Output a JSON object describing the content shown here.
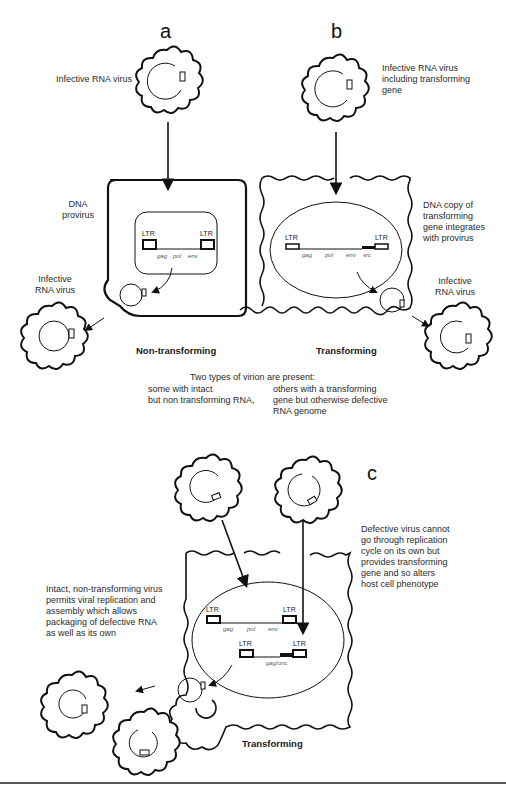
{
  "panels": {
    "a": {
      "letter": "a",
      "top_label": "Infective RNA virus",
      "side_label": [
        "DNA",
        "provirus"
      ],
      "exit_label": [
        "Infective",
        "RNA virus"
      ],
      "genes": [
        "gag",
        "pol",
        "env"
      ],
      "ltr": "LTR",
      "caption": "Non-transforming"
    },
    "b": {
      "letter": "b",
      "top_label": [
        "Infective RNA virus",
        "including transforming",
        "gene"
      ],
      "side_label": [
        "DNA copy of",
        "transforming",
        "gene integrates",
        "with provirus"
      ],
      "exit_label": [
        "Infective",
        "RNA virus"
      ],
      "genes": [
        "gag",
        "pol",
        "env",
        "src"
      ],
      "ltr": "LTR",
      "caption": "Transforming"
    },
    "middle": {
      "heading": "Two types of virion are present:",
      "left": [
        "some with intact",
        "but non transforming RNA,"
      ],
      "right": [
        "others with a transforming",
        "gene but otherwise defective",
        "RNA genome"
      ]
    },
    "c": {
      "letter": "c",
      "right_label": [
        "Defective virus cannot",
        "go through replication",
        "cycle on its own but",
        "provides transforming",
        "gene and so alters",
        "host cell phenotype"
      ],
      "left_label": [
        "Intact, non-transforming virus",
        "permits viral replication and",
        "assembly which allows",
        "packaging of defective RNA",
        "as well as its own"
      ],
      "genes_top": [
        "gag",
        "pol",
        "env"
      ],
      "genes_bottom": "gag/onc",
      "ltr": "LTR",
      "caption": "Transforming"
    }
  },
  "colors": {
    "line": "#111111",
    "text": "#2a2a2a",
    "background": "#ffffff"
  }
}
